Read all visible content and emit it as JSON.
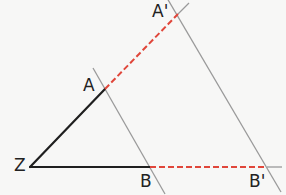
{
  "diagram": {
    "type": "geometry-parallel-projection",
    "points": {
      "Z": {
        "label": "Z",
        "x": 30,
        "y": 167
      },
      "A": {
        "label": "A",
        "x": 105,
        "y": 89
      },
      "A_prime": {
        "label": "A'",
        "x": 178,
        "y": 14
      },
      "B": {
        "label": "B",
        "x": 150,
        "y": 167
      },
      "B_prime": {
        "label": "B'",
        "x": 267,
        "y": 167
      }
    },
    "segments": [
      {
        "from": "Z",
        "to": "A",
        "style": "solid",
        "color": "#1f1f1f"
      },
      {
        "from": "Z",
        "to": "B",
        "style": "solid",
        "color": "#1f1f1f"
      },
      {
        "from": "A",
        "to": "A_prime",
        "style": "dashed",
        "color": "#e0463a"
      },
      {
        "from": "B",
        "to": "B_prime",
        "style": "dashed",
        "color": "#e0463a"
      }
    ],
    "parallel_lines": [
      {
        "name": "line-AB",
        "through": [
          "A",
          "B"
        ],
        "color": "#9a9a9a"
      },
      {
        "name": "line-A'B'",
        "through": [
          "A_prime",
          "B_prime"
        ],
        "color": "#9a9a9a"
      }
    ],
    "colors": {
      "background": "#f7f7f6",
      "solid": "#1f1f1f",
      "dashed": "#e0463a",
      "parallel": "#9a9a9a",
      "label": "#222222"
    }
  }
}
